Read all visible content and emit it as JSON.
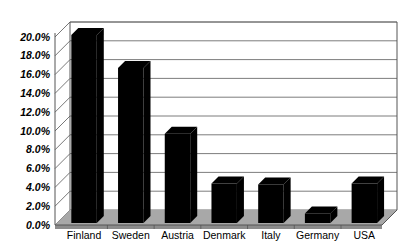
{
  "chart_data": {
    "type": "bar",
    "title": "",
    "subtitle": "",
    "xlabel": "",
    "ylabel": "",
    "categories": [
      "Finland",
      "Sweden",
      "Austria",
      "Denmark",
      "Italy",
      "Germany",
      "USA"
    ],
    "values": [
      20.0,
      16.5,
      9.5,
      4.2,
      4.1,
      1.0,
      4.2
    ],
    "value_labels": [
      "20.0%",
      "16.5%",
      "9.5%",
      "4.2%",
      "4.1%",
      "1.0%",
      "4.2%"
    ],
    "ylim": [
      0.0,
      20.0
    ],
    "ytick_values": [
      0.0,
      2.0,
      4.0,
      6.0,
      8.0,
      10.0,
      12.0,
      14.0,
      16.0,
      18.0,
      20.0
    ],
    "ytick_labels": [
      "0.0%",
      "2.0%",
      "4.0%",
      "6.0%",
      "8.0%",
      "10.0%",
      "12.0%",
      "14.0%",
      "16.0%",
      "18.0%",
      "20.0%"
    ],
    "grid": true,
    "grid_axis": "y",
    "legend": false,
    "legend_position": "none",
    "style": "3d",
    "series": [
      {
        "name": "",
        "values": [
          20.0,
          16.5,
          9.5,
          4.2,
          4.1,
          1.0,
          4.2
        ]
      }
    ]
  },
  "colors": {
    "bar_front": "#000000",
    "bar_top": "#000000",
    "bar_side": "#000000",
    "plot_background": "#ffffff",
    "floor": "#a8a8a8",
    "floor_front_edge": "#8c8c8c",
    "gridline": "#6e6e6e",
    "axis_line": "#555555",
    "text": "#000000",
    "page_background": "#ffffff"
  },
  "axes": {
    "y_axis_name": "percentage-axis",
    "x_axis_name": "country-axis"
  }
}
